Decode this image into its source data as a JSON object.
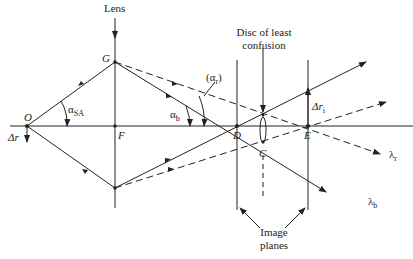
{
  "diagram": {
    "labels": {
      "lens": "Lens",
      "disc": "Disc of least confusion",
      "disc_line1": "Disc of least",
      "disc_line2": "confusion",
      "image_planes_line1": "Image",
      "image_planes_line2": "planes",
      "O": "O",
      "F": "F",
      "G": "G",
      "D": "D",
      "C": "C",
      "E": "E",
      "delta_r": "Δr",
      "delta_ri_main": "Δr",
      "delta_ri_sub": "i",
      "alpha_sa_main": "α",
      "alpha_sa_sub": "SA",
      "alpha_b_main": "α",
      "alpha_b_sub": "b",
      "alpha_r_open": "(α",
      "alpha_r_sub": "r",
      "alpha_r_close": ")",
      "lambda_r_main": "λ",
      "lambda_r_sub": "r",
      "lambda_b_main": "λ",
      "lambda_b_sub": "b"
    },
    "colors": {
      "line": "#222222",
      "background": "#ffffff"
    }
  }
}
